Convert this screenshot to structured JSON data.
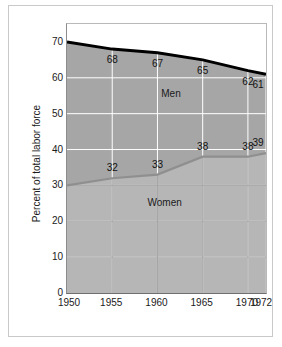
{
  "chart_data": {
    "type": "area",
    "title": "",
    "subtitle": "",
    "xlabel": "",
    "ylabel": "Percent of total labor force",
    "categories": [
      "1950",
      "1955",
      "1960",
      "1965",
      "1970",
      "1972"
    ],
    "x": [
      1950,
      1955,
      1960,
      1965,
      1970,
      1972
    ],
    "xlim": [
      1950,
      1972
    ],
    "ylim": [
      0,
      75
    ],
    "yticks": [
      0,
      10,
      20,
      30,
      40,
      50,
      60,
      70
    ],
    "ytick_labels": [
      "0",
      "10",
      "20",
      "30",
      "40",
      "50",
      "60",
      "70"
    ],
    "grid": true,
    "legend": "inline-annotations",
    "stacked": false,
    "series": [
      {
        "name": "Men",
        "color": "#a6a6a6",
        "line_color": "#000000",
        "values": [
          70,
          68,
          67,
          65,
          62,
          61
        ],
        "point_labels": [
          "",
          "68",
          "67",
          "65",
          "62",
          "61"
        ]
      },
      {
        "name": "Women",
        "color": "#b6b6b6",
        "line_color": "#8f8f8f",
        "values": [
          30,
          32,
          33,
          38,
          38,
          39
        ],
        "point_labels": [
          "",
          "32",
          "33",
          "38",
          "38",
          "39"
        ]
      }
    ],
    "annotations": [
      {
        "text": "Men",
        "x": 1961.5,
        "y": 55.5
      },
      {
        "text": "Women",
        "x": 1960.8,
        "y": 25.0
      }
    ]
  },
  "colors": {
    "men_fill": "#a6a6a6",
    "women_fill": "#b6b6b6",
    "men_line": "#000000",
    "women_line": "#8f8f8f",
    "grid_men": "#ffffff",
    "grid_women": "#a3a3a3",
    "axis": "#6f6f6f",
    "frame": "#c9c9c9",
    "text": "#1a1a1a",
    "background": "#ffffff"
  }
}
